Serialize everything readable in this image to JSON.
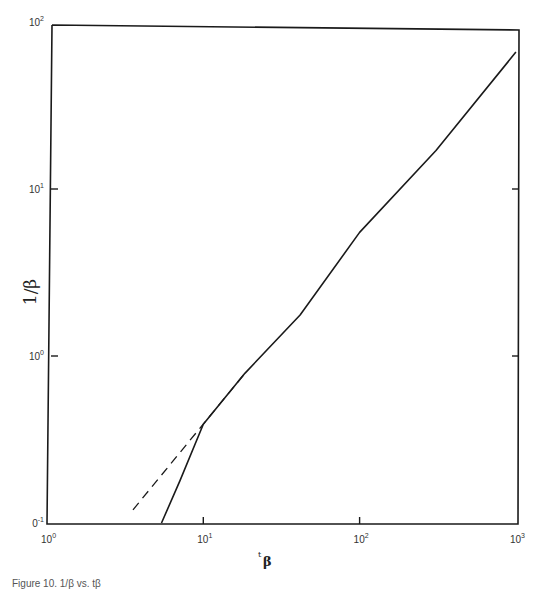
{
  "chart_data": {
    "type": "line",
    "title": "",
    "xlabel": "t_β",
    "ylabel": "1/β",
    "xscale": "log",
    "yscale": "log",
    "xlim": [
      1,
      1000
    ],
    "ylim": [
      0.1,
      100
    ],
    "grid": false,
    "legend": null,
    "x_ticks": [
      {
        "value": 1,
        "base": "10",
        "exp": "0"
      },
      {
        "value": 10,
        "base": "10",
        "exp": "1"
      },
      {
        "value": 100,
        "base": "10",
        "exp": "2"
      },
      {
        "value": 1000,
        "base": "10",
        "exp": "3"
      }
    ],
    "y_ticks": [
      {
        "value": 0.1,
        "base": "0",
        "exp": "-1"
      },
      {
        "value": 1,
        "base": "10",
        "exp": "0"
      },
      {
        "value": 10,
        "base": "10",
        "exp": "1"
      },
      {
        "value": 100,
        "base": "10",
        "exp": "2"
      }
    ],
    "series": [
      {
        "name": "solid curve",
        "style": "solid",
        "x": [
          5.4,
          7.1,
          10,
          18.5,
          41.6,
          100,
          308,
          1000
        ],
        "y": [
          0.1,
          0.18,
          0.39,
          0.79,
          1.76,
          5.5,
          17,
          66
        ]
      },
      {
        "name": "dashed asymptote",
        "style": "dashed",
        "x": [
          3.55,
          18.5
        ],
        "y": [
          0.12,
          0.79
        ]
      }
    ]
  },
  "labels": {
    "ylabel_text": "1/β",
    "xlabel_sup": "t",
    "xlabel_main": "β"
  },
  "caption": "Figure 10. 1/β vs. tβ"
}
